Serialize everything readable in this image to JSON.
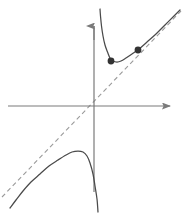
{
  "figure": {
    "width": 188,
    "height": 214,
    "background": "#ffffff",
    "title": "",
    "caption": ""
  },
  "colors": {
    "curve": "#4a4a4a",
    "axis": "#7a7a7a",
    "asymptote_dashed": "#9a9a9a",
    "point_fill": "#333333",
    "background": "#ffffff"
  },
  "chart_data": {
    "type": "line",
    "title": "",
    "subtitle": "",
    "xlabel": "",
    "ylabel": "",
    "grid": false,
    "legend": false,
    "legend_position": "none",
    "axes": {
      "x_axis": {
        "label": "",
        "tick_labels": [],
        "arrow": "right",
        "pixel_y": 106,
        "pixel_x_start": 8,
        "pixel_x_end": 176
      },
      "y_axis": {
        "label": "",
        "tick_labels": [],
        "arrow": "up",
        "pixel_x": 94,
        "pixel_y_start": 18,
        "pixel_y_end": 192
      },
      "origin_pixel": [
        94,
        106
      ],
      "xlim": [
        -2.4,
        2.3
      ],
      "ylim": [
        -2.4,
        2.45
      ]
    },
    "series": [
      {
        "name": "upper-right branch",
        "style": "solid",
        "color": "#4a4a4a",
        "description": "Branch descending steeply from top near the vertical asymptote, reaching a local minimum then increasing toward the slant asymptote",
        "points_pixel": [
          [
            100,
            9
          ],
          [
            100.5,
            16
          ],
          [
            101.5,
            26
          ],
          [
            103,
            36
          ],
          [
            105,
            45
          ],
          [
            107.5,
            52
          ],
          [
            110,
            58
          ],
          [
            113,
            61
          ],
          [
            117,
            62
          ],
          [
            121,
            61
          ],
          [
            126,
            58
          ],
          [
            132,
            54
          ],
          [
            139,
            49
          ],
          [
            147,
            42
          ],
          [
            156,
            34
          ],
          [
            165,
            25
          ],
          [
            174,
            16
          ],
          [
            180,
            10
          ]
        ]
      },
      {
        "name": "lower-left branch",
        "style": "solid",
        "color": "#4a4a4a",
        "description": "Branch rising from lower left along the slant asymptote, reaching a local maximum then falling steeply toward the vertical asymptote",
        "points_pixel": [
          [
            10,
            208
          ],
          [
            16,
            200
          ],
          [
            23,
            191
          ],
          [
            31,
            182
          ],
          [
            40,
            174
          ],
          [
            49,
            166
          ],
          [
            58,
            160
          ],
          [
            66,
            155
          ],
          [
            72,
            152
          ],
          [
            78,
            151
          ],
          [
            83,
            152
          ],
          [
            87,
            156
          ],
          [
            90,
            163
          ],
          [
            93,
            174
          ],
          [
            95,
            186
          ],
          [
            97,
            199
          ],
          [
            98,
            212
          ]
        ]
      },
      {
        "name": "slant asymptote",
        "style": "dashed",
        "color": "#9a9a9a",
        "description": "Oblique asymptote, a straight dashed line of slope about 1 passing through the origin",
        "points_pixel": [
          [
            2,
            197
          ],
          [
            181,
            11
          ]
        ]
      },
      {
        "name": "vertical asymptote",
        "style": "solid-axis",
        "color": "#7a7a7a",
        "description": "The y-axis itself acts as the vertical asymptote for both branches",
        "points_pixel": [
          [
            94,
            18
          ],
          [
            94,
            192
          ]
        ]
      }
    ],
    "marked_points": [
      {
        "name": "local-minimum-point",
        "label": "",
        "pixel": [
          111,
          61
        ],
        "radius": 3.4,
        "data_estimate": [
          0.7,
          1.9
        ]
      },
      {
        "name": "secant-point",
        "label": "",
        "pixel": [
          138,
          50
        ],
        "radius": 3.4,
        "data_estimate": [
          2.1,
          2.5
        ]
      }
    ],
    "annotations": []
  }
}
